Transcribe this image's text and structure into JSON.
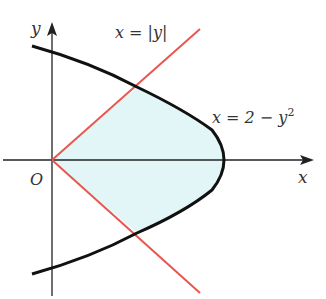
{
  "figure": {
    "labels": {
      "y_axis": "y",
      "x_axis": "x",
      "origin": "O",
      "line_eq": "x = |y|",
      "parabola_eq_base": "x = 2 − y",
      "parabola_exp": "2"
    },
    "colors": {
      "line": "#e8574f",
      "curve": "#111111",
      "fill": "#e3f6f7",
      "axes": "#222222"
    }
  }
}
